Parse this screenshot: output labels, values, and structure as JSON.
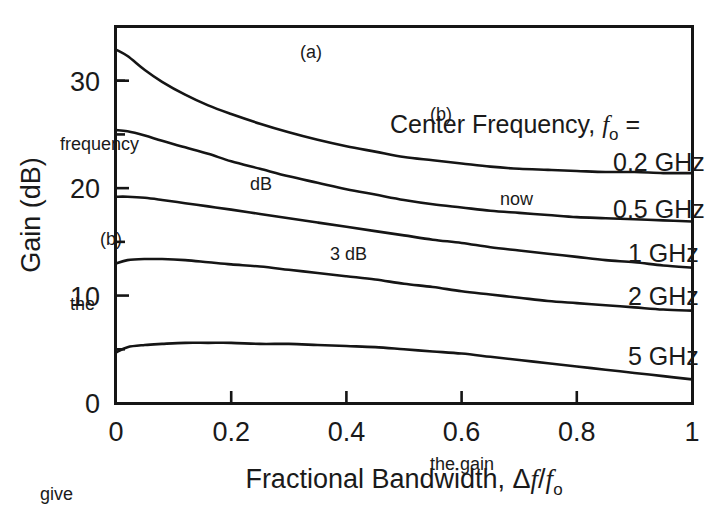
{
  "figure": {
    "background_color": "#ffffff",
    "ink_color": "#151515"
  },
  "chart_data": {
    "type": "line",
    "title": "",
    "xlabel_parts": {
      "lead": "Fractional Bandwidth, ",
      "delta": "Δ",
      "f1": "f",
      "slash": "/",
      "f2": "f",
      "sub": "o"
    },
    "ylabel": "Gain (dB)",
    "xlim": [
      0,
      1
    ],
    "ylim": [
      0,
      35
    ],
    "xticks": [
      0,
      0.2,
      0.4,
      0.6,
      0.8,
      1
    ],
    "xtick_labels": [
      "0",
      "0.2",
      "0.4",
      "0.6",
      "0.8",
      "1"
    ],
    "yticks": [
      0,
      10,
      20,
      30
    ],
    "ytick_labels": [
      "0",
      "10",
      "20",
      "30"
    ],
    "yminorticks": [
      5,
      15,
      25,
      30
    ],
    "grid": false,
    "legend_position": "inline-right-of-curves",
    "annotation": {
      "lead": "Center Frequency, ",
      "symbol": "f",
      "sub": "o",
      "equals": " ="
    },
    "series": [
      {
        "name": "0.2 GHz",
        "label": "0.2 GHz",
        "x": [
          0.0,
          0.02,
          0.05,
          0.08,
          0.12,
          0.16,
          0.2,
          0.25,
          0.3,
          0.35,
          0.4,
          0.45,
          0.5,
          0.55,
          0.6,
          0.65,
          0.7,
          0.75,
          0.8,
          0.85,
          0.9,
          0.95,
          1.0
        ],
        "y": [
          32.9,
          32.3,
          31.0,
          29.9,
          28.7,
          27.7,
          26.9,
          26.0,
          25.2,
          24.5,
          23.9,
          23.4,
          22.9,
          22.6,
          22.3,
          22.0,
          21.8,
          21.7,
          21.6,
          21.5,
          21.5,
          21.4,
          21.4
        ]
      },
      {
        "name": "0.5 GHz",
        "label": "0.5 GHz",
        "x": [
          0.0,
          0.02,
          0.05,
          0.08,
          0.12,
          0.16,
          0.2,
          0.25,
          0.3,
          0.35,
          0.4,
          0.45,
          0.5,
          0.55,
          0.6,
          0.65,
          0.7,
          0.75,
          0.8,
          0.85,
          0.9,
          0.95,
          1.0
        ],
        "y": [
          25.4,
          25.3,
          24.9,
          24.4,
          23.8,
          23.2,
          22.5,
          21.8,
          21.1,
          20.5,
          19.9,
          19.4,
          18.9,
          18.5,
          18.2,
          17.9,
          17.7,
          17.5,
          17.3,
          17.2,
          17.1,
          17.0,
          16.9
        ]
      },
      {
        "name": "1 GHz",
        "label": "1 GHz",
        "x": [
          0.0,
          0.02,
          0.05,
          0.08,
          0.12,
          0.16,
          0.2,
          0.25,
          0.3,
          0.35,
          0.4,
          0.45,
          0.5,
          0.55,
          0.6,
          0.65,
          0.7,
          0.75,
          0.8,
          0.85,
          0.9,
          0.95,
          1.0
        ],
        "y": [
          19.2,
          19.2,
          19.1,
          18.9,
          18.6,
          18.3,
          18.0,
          17.6,
          17.2,
          16.8,
          16.4,
          16.0,
          15.6,
          15.2,
          14.9,
          14.5,
          14.2,
          13.9,
          13.6,
          13.3,
          13.1,
          12.8,
          12.6
        ]
      },
      {
        "name": "2 GHz",
        "label": "2 GHz",
        "x": [
          0.0,
          0.02,
          0.05,
          0.08,
          0.12,
          0.16,
          0.2,
          0.25,
          0.3,
          0.35,
          0.4,
          0.45,
          0.5,
          0.55,
          0.6,
          0.65,
          0.7,
          0.75,
          0.8,
          0.85,
          0.9,
          0.95,
          1.0
        ],
        "y": [
          13.0,
          13.3,
          13.4,
          13.4,
          13.3,
          13.1,
          12.9,
          12.7,
          12.4,
          12.1,
          11.8,
          11.5,
          11.1,
          10.8,
          10.4,
          10.1,
          9.8,
          9.5,
          9.3,
          9.1,
          8.9,
          8.7,
          8.6
        ]
      },
      {
        "name": "5 GHz",
        "label": "5 GHz",
        "x": [
          0.0,
          0.02,
          0.05,
          0.08,
          0.12,
          0.16,
          0.2,
          0.25,
          0.3,
          0.35,
          0.4,
          0.45,
          0.5,
          0.55,
          0.6,
          0.65,
          0.7,
          0.75,
          0.8,
          0.85,
          0.9,
          0.95,
          1.0
        ],
        "y": [
          4.7,
          5.2,
          5.4,
          5.5,
          5.6,
          5.6,
          5.6,
          5.5,
          5.5,
          5.4,
          5.3,
          5.2,
          5.0,
          4.8,
          4.6,
          4.3,
          4.0,
          3.7,
          3.4,
          3.1,
          2.8,
          2.5,
          2.2
        ]
      }
    ],
    "series_end_labels": [
      {
        "label": "0.2 GHz",
        "x_px": 613,
        "y_px": 171
      },
      {
        "label": "0.5 GHz",
        "x_px": 613,
        "y_px": 218
      },
      {
        "label": "1 GHz",
        "x_px": 628,
        "y_px": 262
      },
      {
        "label": "2 GHz",
        "x_px": 628,
        "y_px": 305
      },
      {
        "label": "5 GHz",
        "x_px": 628,
        "y_px": 365
      }
    ]
  },
  "bleed_through": [
    {
      "text": "(a)",
      "x": 300,
      "y": 58
    },
    {
      "text": "(b)",
      "x": 430,
      "y": 120
    },
    {
      "text": "frequency",
      "x": 60,
      "y": 150
    },
    {
      "text": "dB",
      "x": 250,
      "y": 190
    },
    {
      "text": "now",
      "x": 500,
      "y": 205
    },
    {
      "text": "(b)",
      "x": 100,
      "y": 245
    },
    {
      "text": "3 dB",
      "x": 330,
      "y": 260
    },
    {
      "text": "the",
      "x": 70,
      "y": 310
    },
    {
      "text": "the gain",
      "x": 430,
      "y": 470
    },
    {
      "text": "give",
      "x": 40,
      "y": 500
    }
  ]
}
